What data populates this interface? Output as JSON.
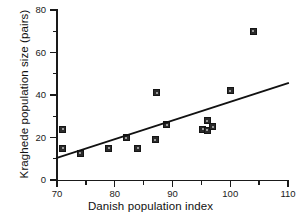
{
  "chart_data": {
    "type": "scatter",
    "title": "",
    "xlabel": "Danish population index",
    "ylabel": "Kraghede population size (pairs)",
    "xlim": [
      70,
      110
    ],
    "ylim": [
      0,
      80
    ],
    "x_ticks": [
      70,
      80,
      90,
      100,
      110
    ],
    "x_tick_labels": [
      "70",
      "80",
      "90",
      "100",
      "110"
    ],
    "x_minor_ticks": [
      75,
      85,
      95,
      105
    ],
    "y_ticks": [
      0,
      20,
      40,
      60,
      80
    ],
    "y_tick_labels": [
      "0",
      "20",
      "40",
      "60",
      "80"
    ],
    "y_minor_ticks": [
      10,
      30,
      50,
      70
    ],
    "grid": false,
    "legend": false,
    "marker_style": "filled-square",
    "marker_color": "#2b2b2b",
    "line_color": "#111111",
    "points": [
      {
        "x": 71.0,
        "y": 24.0
      },
      {
        "x": 71.0,
        "y": 15.0
      },
      {
        "x": 74.0,
        "y": 12.5
      },
      {
        "x": 79.0,
        "y": 15.0
      },
      {
        "x": 82.0,
        "y": 20.0
      },
      {
        "x": 84.0,
        "y": 15.0
      },
      {
        "x": 87.3,
        "y": 41.0
      },
      {
        "x": 87.0,
        "y": 19.0
      },
      {
        "x": 89.0,
        "y": 26.0
      },
      {
        "x": 95.2,
        "y": 24.0
      },
      {
        "x": 96.0,
        "y": 28.0
      },
      {
        "x": 96.0,
        "y": 23.5
      },
      {
        "x": 97.0,
        "y": 25.0
      },
      {
        "x": 100.0,
        "y": 42.0
      },
      {
        "x": 104.0,
        "y": 70.0
      }
    ],
    "trend_line": {
      "label": "regression-line",
      "x_start": 70,
      "y_start": 10.4,
      "x_end": 110,
      "y_end": 45.6
    }
  }
}
